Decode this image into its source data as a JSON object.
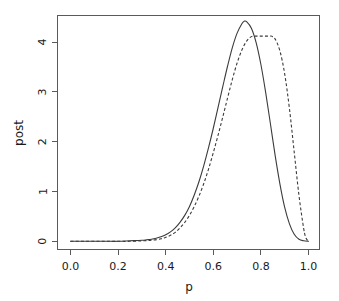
{
  "chart_data": {
    "type": "line",
    "title": "",
    "xlabel": "p",
    "ylabel": "post",
    "xlim": [
      0.0,
      1.0
    ],
    "ylim": [
      -0.18,
      4.62
    ],
    "grid": false,
    "legend": "none",
    "x_ticks": [
      "0.0",
      "0.2",
      "0.4",
      "0.6",
      "0.8",
      "1.0"
    ],
    "x_tick_values": [
      0.0,
      0.2,
      0.4,
      0.6,
      0.8,
      1.0
    ],
    "y_ticks": [
      "0",
      "1",
      "2",
      "3",
      "4"
    ],
    "y_tick_values": [
      0,
      1,
      2,
      3,
      4
    ],
    "series": [
      {
        "name": "solid-posterior",
        "style": "solid",
        "color": "#3b3b3b",
        "peak_x": 0.73,
        "peak_y": 4.42,
        "x": [
          0.0,
          0.05,
          0.1,
          0.15,
          0.2,
          0.25,
          0.3,
          0.32,
          0.34,
          0.36,
          0.38,
          0.4,
          0.42,
          0.44,
          0.46,
          0.48,
          0.5,
          0.52,
          0.54,
          0.56,
          0.58,
          0.6,
          0.62,
          0.64,
          0.66,
          0.68,
          0.7,
          0.72,
          0.73,
          0.74,
          0.76,
          0.78,
          0.8,
          0.82,
          0.84,
          0.86,
          0.88,
          0.9,
          0.92,
          0.94,
          0.96,
          0.98,
          1.0
        ],
        "values": [
          0.0,
          0.0,
          0.0,
          0.0,
          0.0,
          0.01,
          0.02,
          0.03,
          0.04,
          0.06,
          0.09,
          0.13,
          0.19,
          0.27,
          0.38,
          0.52,
          0.7,
          0.93,
          1.2,
          1.52,
          1.88,
          2.27,
          2.69,
          3.11,
          3.52,
          3.89,
          4.18,
          4.37,
          4.42,
          4.41,
          4.28,
          3.99,
          3.55,
          2.99,
          2.36,
          1.72,
          1.15,
          0.68,
          0.35,
          0.14,
          0.04,
          0.01,
          0.0
        ]
      },
      {
        "name": "dashed-posterior",
        "style": "dashed",
        "color": "#3b3b3b",
        "peak_x": 0.845,
        "peak_y": 4.12,
        "x": [
          0.0,
          0.05,
          0.1,
          0.15,
          0.2,
          0.25,
          0.3,
          0.34,
          0.38,
          0.4,
          0.42,
          0.44,
          0.46,
          0.48,
          0.5,
          0.52,
          0.54,
          0.56,
          0.58,
          0.6,
          0.62,
          0.64,
          0.66,
          0.68,
          0.7,
          0.72,
          0.74,
          0.76,
          0.78,
          0.8,
          0.82,
          0.84,
          0.845,
          0.86,
          0.88,
          0.9,
          0.92,
          0.94,
          0.96,
          0.98,
          0.99,
          1.0
        ],
        "values": [
          0.0,
          0.0,
          0.0,
          0.0,
          0.0,
          0.0,
          0.01,
          0.02,
          0.05,
          0.08,
          0.12,
          0.18,
          0.27,
          0.38,
          0.52,
          0.7,
          0.91,
          1.16,
          1.45,
          1.78,
          2.13,
          2.5,
          2.88,
          3.25,
          3.58,
          3.84,
          4.02,
          4.11,
          4.12,
          4.12,
          4.12,
          4.12,
          4.12,
          4.06,
          3.82,
          3.36,
          2.66,
          1.79,
          0.92,
          0.25,
          0.06,
          0.0
        ]
      }
    ],
    "intersection_note": "curves cross near p=0.79 at post=3.6"
  }
}
